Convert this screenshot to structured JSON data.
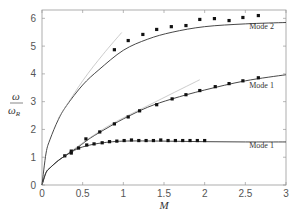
{
  "chart_data": {
    "type": "line",
    "title": "",
    "xlabel": "M",
    "ylabel": "ω / ω_R",
    "ylabel_num": "ω",
    "ylabel_den": "ω",
    "ylabel_den_sub": "R",
    "xlim": [
      0,
      3
    ],
    "ylim": [
      0,
      6.3
    ],
    "xticks": [
      0,
      0.5,
      1,
      1.5,
      2,
      2.5,
      3
    ],
    "xtick_labels": [
      "0",
      "0.5",
      "1",
      "1.5",
      "2",
      "2.5",
      "3"
    ],
    "yticks": [
      0,
      1,
      2,
      3,
      4,
      5,
      6
    ],
    "ytick_labels": [
      "0",
      "1",
      "2",
      "3",
      "4",
      "5",
      "6"
    ],
    "grid": false,
    "legend": null,
    "annotations": [
      {
        "text": "Mode 2",
        "x": 2.7,
        "y": 5.6
      },
      {
        "text": "Mode 1",
        "x": 2.7,
        "y": 3.5
      },
      {
        "text": "Mode 1",
        "x": 2.7,
        "y": 1.35
      }
    ],
    "series": [
      {
        "name": "Mode 2 (theory)",
        "style": "solid",
        "x": [
          0,
          0.05,
          0.1,
          0.2,
          0.3,
          0.5,
          0.7,
          1.0,
          1.3,
          1.6,
          2.0,
          2.5,
          3.0
        ],
        "y": [
          0,
          1.15,
          1.65,
          2.35,
          2.85,
          3.6,
          4.15,
          4.85,
          5.25,
          5.5,
          5.7,
          5.8,
          5.85
        ]
      },
      {
        "name": "Mode 2 (tangent)",
        "style": "thin",
        "x": [
          0.2,
          0.5,
          0.75,
          0.98
        ],
        "y": [
          2.4,
          3.75,
          4.7,
          5.49
        ]
      },
      {
        "name": "Mode 2 (data)",
        "style": "markers",
        "x": [
          0.89,
          1.06,
          1.24,
          1.41,
          1.59,
          1.77,
          1.94,
          2.12,
          2.3,
          2.47,
          2.66
        ],
        "y": [
          4.87,
          5.2,
          5.42,
          5.6,
          5.7,
          5.74,
          5.96,
          5.99,
          5.92,
          6.03,
          6.1
        ]
      },
      {
        "name": "Mode 1 upper (theory)",
        "style": "solid",
        "x": [
          0,
          0.05,
          0.1,
          0.2,
          0.3,
          0.45,
          0.6,
          0.8,
          1.0,
          1.3,
          1.6,
          2.0,
          2.5,
          3.0
        ],
        "y": [
          0,
          0.45,
          0.62,
          0.88,
          1.08,
          1.38,
          1.7,
          2.05,
          2.38,
          2.8,
          3.1,
          3.42,
          3.75,
          3.97
        ]
      },
      {
        "name": "Mode 1 upper (tangent)",
        "style": "thin",
        "x": [
          0.3,
          0.8,
          1.4,
          1.94
        ],
        "y": [
          1.1,
          2.1,
          3.0,
          3.79
        ]
      },
      {
        "name": "Mode 1 upper (data)",
        "style": "markers",
        "x": [
          0.28,
          0.36,
          0.54,
          0.71,
          0.89,
          1.06,
          1.2,
          1.41,
          1.6,
          1.77,
          1.94,
          2.13,
          2.3,
          2.47,
          2.66
        ],
        "y": [
          1.05,
          1.22,
          1.66,
          1.91,
          2.2,
          2.45,
          2.67,
          2.89,
          3.1,
          3.25,
          3.4,
          3.54,
          3.65,
          3.75,
          3.86
        ]
      },
      {
        "name": "Mode 1 lower (theory)",
        "style": "solid",
        "x": [
          0,
          0.05,
          0.1,
          0.2,
          0.3,
          0.4,
          0.5,
          0.7,
          1.0,
          1.5,
          2.0,
          2.5,
          3.0
        ],
        "y": [
          0,
          0.45,
          0.62,
          0.88,
          1.08,
          1.25,
          1.37,
          1.5,
          1.58,
          1.58,
          1.56,
          1.55,
          1.55
        ]
      },
      {
        "name": "Mode 1 lower (data)",
        "style": "markers",
        "x": [
          0.36,
          0.45,
          0.55,
          0.64,
          0.74,
          0.83,
          0.92,
          1.01,
          1.1,
          1.19,
          1.28,
          1.37,
          1.46,
          1.55,
          1.64,
          1.73,
          1.82,
          1.91,
          2.0
        ],
        "y": [
          1.15,
          1.33,
          1.44,
          1.48,
          1.52,
          1.56,
          1.58,
          1.6,
          1.62,
          1.6,
          1.6,
          1.6,
          1.62,
          1.6,
          1.6,
          1.6,
          1.6,
          1.6,
          1.6
        ]
      }
    ]
  }
}
